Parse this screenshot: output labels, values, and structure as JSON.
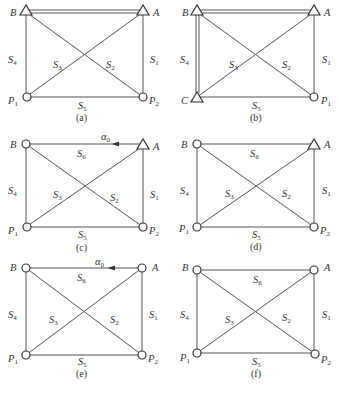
{
  "figure": {
    "panels": [
      {
        "id": "a",
        "caption": "(a)",
        "nodes": {
          "B": "triangle",
          "A": "triangle",
          "P1": "circle",
          "P2": "circle"
        },
        "corner_labels": {
          "tl": "B",
          "tr": "A",
          "bl": "P1",
          "br": "P2"
        },
        "edges": [
          "S1",
          "S2",
          "S3",
          "S4",
          "S5"
        ],
        "known_baseline": "B-A"
      },
      {
        "id": "b",
        "caption": "(b)",
        "nodes": {
          "B": "triangle",
          "A": "triangle",
          "C": "triangle",
          "P1": "circle"
        },
        "corner_labels": {
          "tl": "B",
          "tr": "A",
          "bl": "C",
          "br": "P1"
        },
        "edges": [
          "S1",
          "S2",
          "S3",
          "S4",
          "S5"
        ],
        "known_baselines": [
          "B-A",
          "B-C"
        ]
      },
      {
        "id": "c",
        "caption": "(c)",
        "nodes": {
          "B": "circle",
          "A": "triangle",
          "P1": "circle",
          "P2": "circle"
        },
        "corner_labels": {
          "tl": "B",
          "tr": "A",
          "bl": "P1",
          "br": "P2"
        },
        "edges": [
          "S1",
          "S2",
          "S3",
          "S4",
          "S5",
          "S6"
        ],
        "azimuth": "α0"
      },
      {
        "id": "d",
        "caption": "(d)",
        "nodes": {
          "B": "circle",
          "A": "triangle",
          "P1": "circle",
          "P2": "circle"
        },
        "corner_labels": {
          "tl": "B",
          "tr": "A",
          "bl": "P1",
          "br": "P2"
        },
        "edges": [
          "S1",
          "S2",
          "S3",
          "S4",
          "S5",
          "S6"
        ]
      },
      {
        "id": "e",
        "caption": "(e)",
        "nodes": {
          "B": "circle",
          "A": "circle",
          "P1": "circle",
          "P2": "circle"
        },
        "corner_labels": {
          "tl": "B",
          "tr": "A",
          "bl": "P1",
          "br": "P2"
        },
        "edges": [
          "S1",
          "S2",
          "S3",
          "S4",
          "S5",
          "S6"
        ],
        "azimuth": "α0"
      },
      {
        "id": "f",
        "caption": "(f)",
        "nodes": {
          "B": "circle",
          "A": "circle",
          "P1": "circle",
          "P2": "circle"
        },
        "corner_labels": {
          "tl": "B",
          "tr": "A",
          "bl": "P1",
          "br": "P2"
        },
        "edges": [
          "S1",
          "S2",
          "S3",
          "S4",
          "S5",
          "S6"
        ]
      }
    ],
    "edge_labels": {
      "S1": "S",
      "S1_sub": "1",
      "S2": "S",
      "S2_sub": "2",
      "S3": "S",
      "S3_sub": "3",
      "S4": "S",
      "S4_sub": "4",
      "S5": "S",
      "S5_sub": "5",
      "S6": "S",
      "S6_sub": "6"
    },
    "text": {
      "a": {
        "caption": "(a)",
        "tl": "B",
        "tr": "A",
        "bl": "P",
        "bl_sub": "1",
        "br": "P",
        "br_sub": "2"
      },
      "b": {
        "caption": "(b)",
        "tl": "B",
        "tr": "A",
        "bl": "C",
        "br": "P",
        "br_sub": "1"
      },
      "c": {
        "caption": "(c)",
        "tl": "B",
        "tr": "A",
        "bl": "P",
        "bl_sub": "1",
        "br": "P",
        "br_sub": "2",
        "az": "α",
        "az_sub": "0"
      },
      "d": {
        "caption": "(d)",
        "tl": "B",
        "tr": "A",
        "bl": "P",
        "bl_sub": "1",
        "br": "P",
        "br_sub": "2"
      },
      "e": {
        "caption": "(e)",
        "tl": "B",
        "tr": "A",
        "bl": "P",
        "bl_sub": "1",
        "br": "P",
        "br_sub": "2",
        "az": "α",
        "az_sub": "0"
      },
      "f": {
        "caption": "(f)",
        "tl": "B",
        "tr": "A",
        "bl": "P",
        "bl_sub": "1",
        "br": "P",
        "br_sub": "2"
      }
    }
  }
}
